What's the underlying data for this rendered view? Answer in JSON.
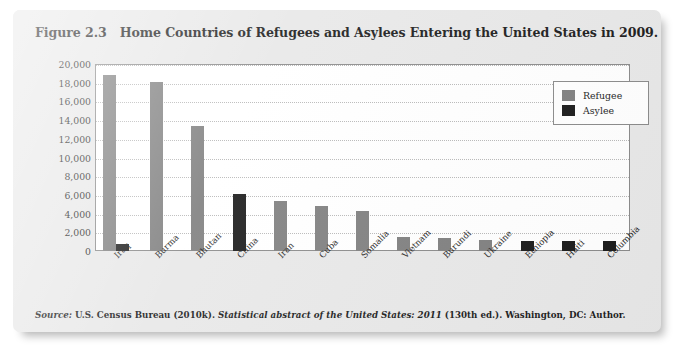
{
  "figure": {
    "number_label": "Figure 2.3",
    "caption": "Home Countries of Refugees and Asylees Entering the United States in 2009."
  },
  "source_note": {
    "label": "Source:",
    "publisher": "U.S. Census Bureau (2010k).",
    "work_title": "Statistical abstract of the United States: 2011",
    "edition_and_place": "(130th ed.). Washington, DC: Author."
  },
  "legend": {
    "position": "top-right-inside-plot",
    "entries": [
      {
        "label": "Refugee",
        "color": "#7f7f7f"
      },
      {
        "label": "Asylee",
        "color": "#1a1a1a"
      }
    ]
  },
  "chart_data": {
    "type": "bar",
    "title": "Home Countries of Refugees and Asylees Entering the United States in 2009.",
    "xlabel": "",
    "ylabel": "",
    "ylim": [
      0,
      20000
    ],
    "ytick_values": [
      0,
      2000,
      4000,
      6000,
      8000,
      10000,
      12000,
      14000,
      16000,
      18000,
      20000
    ],
    "ytick_labels": [
      "0",
      "2,000",
      "4,000",
      "6,000",
      "8,000",
      "10,000",
      "12,000",
      "14,000",
      "16,000",
      "18,000",
      "20,000"
    ],
    "grid": true,
    "grid_axis": "y",
    "legend_position": "upper right",
    "categories": [
      "Iraq",
      "Burma",
      "Bhutan",
      "China",
      "Iran",
      "Cuba",
      "Somalia",
      "Vietnam",
      "Burundi",
      "Ukraine",
      "Ethiopia",
      "Haiti",
      "Columbia"
    ],
    "series": [
      {
        "name": "Refugee",
        "color": "#7f7f7f",
        "values": [
          18800,
          18100,
          13400,
          0,
          5400,
          4800,
          4300,
          1500,
          1400,
          1200,
          0,
          0,
          0
        ]
      },
      {
        "name": "Asylee",
        "color": "#1a1a1a",
        "values": [
          700,
          0,
          0,
          6100,
          0,
          0,
          0,
          0,
          0,
          0,
          1100,
          1100,
          1100
        ]
      }
    ]
  }
}
